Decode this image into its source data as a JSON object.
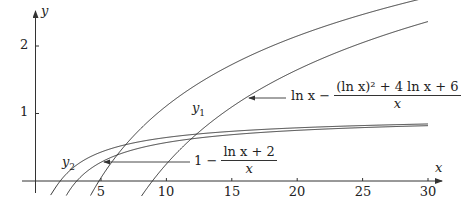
{
  "chart_data": {
    "type": "line",
    "title": "",
    "xlabel": "x",
    "ylabel": "y",
    "xlim": [
      0,
      30
    ],
    "ylim": [
      0,
      2.4
    ],
    "grid": false,
    "x_ticks": [
      5,
      10,
      15,
      20,
      25,
      30
    ],
    "y_ticks": [
      1,
      2
    ],
    "series": [
      {
        "name": "y1",
        "formula": "ln x - ((ln x)^2 + 2 ln x + 2)/x",
        "label": "y1"
      },
      {
        "name": "ln x - ((ln x)^2 + 4 ln x + 6)/x",
        "formula": "ln x - ((ln x)^2 + 4 ln x + 6)/x",
        "label": "ln x − ((ln x)² + 4 ln x + 6)/x"
      },
      {
        "name": "y2",
        "formula": "1 - (ln x + 1)/x",
        "label": "y2"
      },
      {
        "name": "1 - (ln x + 2)/x",
        "formula": "1 - (ln x + 2)/x",
        "label": "1 − (ln x + 2)/x"
      }
    ],
    "annotations": [
      {
        "text": "y1",
        "near_x": 12.2,
        "near_y": 1.05
      },
      {
        "text": "y2",
        "near_x": 2.5,
        "near_y": 0.33
      },
      {
        "text": "ln x − ((ln x)² + 4 ln x + 6)/x",
        "arrow_to_x": 16,
        "arrow_to_y": 1.23
      },
      {
        "text": "1 − (ln x + 2)/x",
        "arrow_to_x": 5,
        "arrow_to_y": 0.28
      }
    ]
  },
  "axes": {
    "x_label": "x",
    "y_label": "y",
    "x_tick_labels": [
      "5",
      "10",
      "15",
      "20",
      "25",
      "30"
    ],
    "y_tick_labels": [
      "1",
      "2"
    ]
  },
  "labels": {
    "y1": "y",
    "y1_sub": "1",
    "y2": "y",
    "y2_sub": "2",
    "upper_formula_prefix": "ln x −",
    "upper_formula_num": "(ln x)² + 4 ln x + 6",
    "upper_formula_den": "x",
    "lower_formula_prefix": "1 −",
    "lower_formula_num": "ln x + 2",
    "lower_formula_den": "x"
  }
}
